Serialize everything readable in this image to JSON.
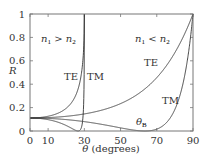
{
  "chart_data": {
    "type": "line",
    "title": "",
    "xlabel": "θ (degrees)",
    "ylabel": "R",
    "xlim": [
      0,
      90
    ],
    "ylim": [
      0,
      1
    ],
    "x_ticks": [
      0,
      10,
      30,
      50,
      70,
      90
    ],
    "y_ticks": [
      0,
      0.2,
      0.4,
      0.6,
      0.8,
      1
    ],
    "x_tick_labels": [
      "0",
      "10",
      "30",
      "50",
      "70",
      "90"
    ],
    "y_tick_labels": [
      "0",
      "0.2",
      "0.4",
      "0.6",
      "0.8",
      "1"
    ],
    "grid": false,
    "legend": null,
    "refractive_index_ratio": 2,
    "series": [
      {
        "name": "TE (n1 > n2)",
        "group": "n1 > n2",
        "x": [
          0,
          10,
          20,
          25,
          28,
          29.5,
          30
        ],
        "values": [
          0.111,
          0.127,
          0.21,
          0.34,
          0.53,
          0.76,
          1.0
        ]
      },
      {
        "name": "TM (n1 > n2)",
        "group": "n1 > n2",
        "x": [
          0,
          10,
          20,
          26.6,
          28,
          29.5,
          30
        ],
        "values": [
          0.111,
          0.096,
          0.045,
          0.0,
          0.03,
          0.35,
          1.0
        ]
      },
      {
        "name": "TE (n1 < n2)",
        "group": "n1 < n2",
        "x": [
          0,
          10,
          30,
          50,
          70,
          80,
          90
        ],
        "values": [
          0.111,
          0.115,
          0.15,
          0.25,
          0.48,
          0.68,
          1.0
        ]
      },
      {
        "name": "TM (n1 < n2)",
        "group": "n1 < n2",
        "x": [
          0,
          10,
          30,
          50,
          63.4,
          70,
          80,
          90
        ],
        "values": [
          0.111,
          0.107,
          0.077,
          0.024,
          0.0,
          0.02,
          0.18,
          1.0
        ]
      }
    ],
    "annotations": [
      {
        "text": "n1 > n2",
        "x": 10,
        "y": 0.8
      },
      {
        "text": "n1 < n2",
        "x": 70,
        "y": 0.8
      },
      {
        "text": "TE",
        "x": 20.5,
        "y": 0.38,
        "series": "TE (n1 > n2)"
      },
      {
        "text": "TM",
        "x": 34,
        "y": 0.38,
        "series": "TM (n1 > n2)"
      },
      {
        "text": "TE",
        "x": 62,
        "y": 0.5,
        "series": "TE (n1 < n2)"
      },
      {
        "text": "TM",
        "x": 73,
        "y": 0.27,
        "series": "TM (n1 < n2)"
      },
      {
        "text": "θB",
        "x": 58,
        "y": 0.06,
        "note": "Brewster angle"
      }
    ]
  },
  "labels": {
    "y_axis": "R",
    "x_axis_symbol": "θ",
    "x_axis_unit": " (degrees)",
    "n1": "n",
    "n1_sub": "1",
    "gt": " > ",
    "lt": " < ",
    "n2": "n",
    "n2_sub": "2",
    "te": "TE",
    "tm": "TM",
    "theta": "θ",
    "brewster_sub": "B"
  }
}
